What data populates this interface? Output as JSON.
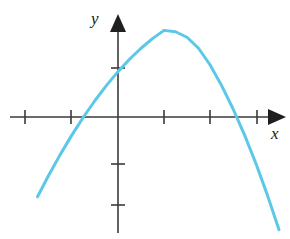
{
  "figure": {
    "background_color": "#ffffff",
    "width": 290,
    "height": 239
  },
  "axes": {
    "x_label": "x",
    "y_label": "y",
    "axis_color": "#3a3a3a",
    "origin_px": {
      "x": 118,
      "y": 117
    },
    "unit_px": 46,
    "x_axis": {
      "start_px": 10,
      "end_px": 286,
      "arrow": "right",
      "tick_positions_px": [
        25,
        71,
        164,
        210,
        257
      ],
      "tick_values": [
        -2,
        -1,
        1,
        2,
        3
      ]
    },
    "y_axis": {
      "start_px": 15,
      "end_px": 233,
      "arrow": "up",
      "tick_positions_px": [
        68,
        164,
        205
      ],
      "tick_values": [
        1,
        -1,
        -2
      ]
    }
  },
  "chart_data": {
    "type": "line",
    "title": "",
    "xlabel": "x",
    "ylabel": "y",
    "grid": false,
    "legend": null,
    "xlim": [
      -2.35,
      3.65
    ],
    "ylim": [
      -2.5,
      2.2
    ],
    "curve_color": "#5BC8E8",
    "curve_width_px": 3,
    "equation": "y = x^2 - 2x - 3",
    "roots": [
      -1,
      3
    ],
    "vertex": [
      1,
      -4
    ],
    "y_intercept": -3,
    "series": [
      {
        "name": "parabola",
        "x": [
          -1.75,
          -1.5,
          -1.25,
          -1.0,
          -0.75,
          -0.5,
          -0.25,
          0.0,
          0.25,
          0.5,
          0.75,
          1.0,
          1.25,
          1.5,
          1.75,
          2.0,
          2.25,
          2.5,
          2.75,
          3.0,
          3.25,
          3.5
        ],
        "values": [
          1.8125,
          1.3125,
          0.8438,
          0.4062,
          0.0,
          -0.375,
          -0.7188,
          -1.0312,
          -1.3125,
          -1.5625,
          -1.7812,
          -1.9688,
          -1.9375,
          -1.8125,
          -1.5625,
          -1.1875,
          -0.7188,
          -0.1875,
          0.4062,
          1.0625,
          1.7812,
          2.5625
        ]
      }
    ],
    "annotations": []
  }
}
